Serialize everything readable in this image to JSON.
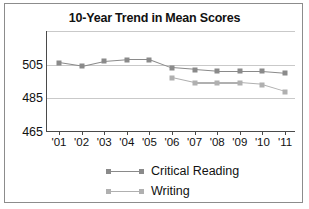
{
  "chart_data": {
    "type": "line",
    "title": "10-Year Trend in Mean Scores",
    "xlabel": "",
    "ylabel": "",
    "x": [
      "'01",
      "'02",
      "'03",
      "'04",
      "'05",
      "'06",
      "'07",
      "'08",
      "'09",
      "'10",
      "'11"
    ],
    "ylim": [
      465,
      525
    ],
    "yticks": [
      465,
      485,
      505
    ],
    "ytick_labels": [
      "465",
      "485",
      "505"
    ],
    "gridlines": [
      465,
      485,
      505,
      525
    ],
    "grid": true,
    "legend_position": "bottom",
    "series": [
      {
        "name": "Critical Reading",
        "color": "#8a8a8a",
        "values": [
          506,
          504,
          507,
          508,
          508,
          503,
          502,
          501,
          501,
          501,
          500
        ]
      },
      {
        "name": "Writing",
        "color": "#b0b0b0",
        "values": [
          null,
          null,
          null,
          null,
          null,
          497,
          494,
          494,
          494,
          493,
          489
        ]
      }
    ]
  },
  "colors": {
    "frame": "#8c8c8c",
    "axis": "#4a4a4a",
    "grid": "#c9c9c9",
    "background": "#ffffff",
    "text": "#111111"
  }
}
